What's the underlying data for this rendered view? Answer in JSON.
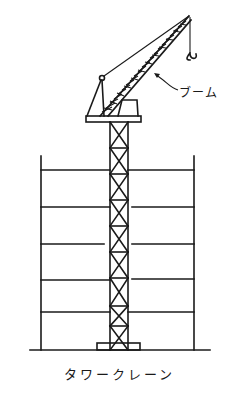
{
  "diagram": {
    "title": "タワークレーン",
    "labels": {
      "boom": "ブーム"
    },
    "components": [
      "boom",
      "hook",
      "mast",
      "cab",
      "tower",
      "building-floors",
      "ground",
      "base"
    ],
    "colors": {
      "line": "#1a1a1a",
      "background": "#ffffff"
    }
  }
}
